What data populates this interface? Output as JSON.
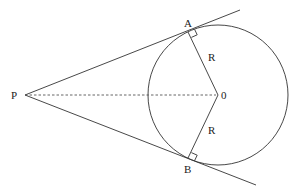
{
  "diagram": {
    "colors": {
      "line": "#333333",
      "dashed": "#555555",
      "text": "#222222",
      "background": "#ffffff"
    },
    "points": {
      "P": {
        "label": "P",
        "x": 25,
        "y": 95
      },
      "O": {
        "label": "0",
        "x": 218,
        "y": 95
      },
      "A": {
        "label": "A",
        "x": 188,
        "y": 32
      },
      "B": {
        "label": "B",
        "x": 188,
        "y": 158
      }
    },
    "circle": {
      "cx": 218,
      "cy": 95,
      "r": 70
    },
    "radius_labels": [
      "R",
      "R"
    ],
    "segments": [
      {
        "name": "tangent-PA",
        "from": "P",
        "through": "A",
        "style": "solid"
      },
      {
        "name": "tangent-PB",
        "from": "P",
        "through": "B",
        "style": "solid"
      },
      {
        "name": "radius-OA",
        "from": "O",
        "to": "A",
        "style": "solid"
      },
      {
        "name": "radius-OB",
        "from": "O",
        "to": "B",
        "style": "solid"
      },
      {
        "name": "line-PO",
        "from": "P",
        "to": "O",
        "style": "dashed"
      }
    ],
    "right_angle_marks": [
      "A",
      "B"
    ]
  }
}
